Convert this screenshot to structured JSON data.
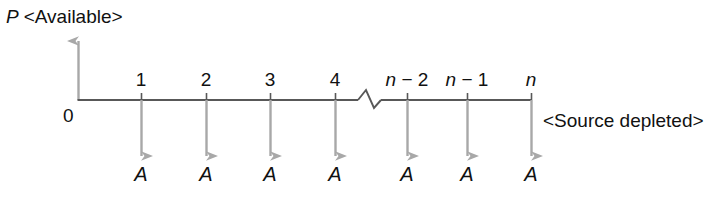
{
  "figure": {
    "type": "timeline-sequence-diagram",
    "background_color": "#ffffff",
    "axis_color": "#585858",
    "arrow_color": "#a8a8a8",
    "text_color": "#111111",
    "vertical_axis_label": {
      "variable": "P",
      "annotation": "<Available>",
      "full": "P <Available>"
    },
    "origin_label": "0",
    "end_note": "<Source depleted>",
    "axis_break": {
      "present": true,
      "style": "zigzag",
      "between_ticks": [
        "4",
        "n − 2"
      ]
    },
    "ticks": [
      {
        "id": "t1",
        "label_plain": "1",
        "var": "",
        "rest": "1",
        "x": 141
      },
      {
        "id": "t2",
        "label_plain": "2",
        "var": "",
        "rest": "2",
        "x": 206
      },
      {
        "id": "t3",
        "label_plain": "3",
        "var": "",
        "rest": "3",
        "x": 270
      },
      {
        "id": "t4",
        "label_plain": "4",
        "var": "",
        "rest": "4",
        "x": 335
      },
      {
        "id": "t5",
        "label_plain": "n − 2",
        "var": "n",
        "rest": " − 2",
        "x": 407
      },
      {
        "id": "t6",
        "label_plain": "n − 1",
        "var": "n",
        "rest": " − 1",
        "x": 467
      },
      {
        "id": "t7",
        "label_plain": "n",
        "var": "n",
        "rest": "",
        "x": 531
      }
    ],
    "products": [
      {
        "label": "A",
        "x": 141
      },
      {
        "label": "A",
        "x": 206
      },
      {
        "label": "A",
        "x": 270
      },
      {
        "label": "A",
        "x": 335
      },
      {
        "label": "A",
        "x": 407
      },
      {
        "label": "A",
        "x": 467
      },
      {
        "label": "A",
        "x": 531
      }
    ],
    "geometry": {
      "axis_y": 100,
      "axis_x_start": 78,
      "axis_x_end": 531,
      "up_arrow_top_y": 40,
      "down_arrow_end_y": 157,
      "tick_label_y": 70,
      "product_label_y": 164
    }
  }
}
